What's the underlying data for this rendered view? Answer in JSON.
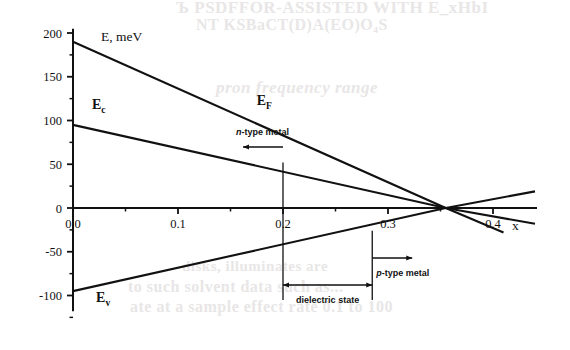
{
  "figure": {
    "background_color": "#ffffff",
    "ink_color": "#111111",
    "bleed_color": "#e8e6e6"
  },
  "bleed_text": {
    "line1": "Ъ PSDFFOR-ASSISTED WITH E_xHbI",
    "line2": "NT KSBaCT(D)A(EO)O₄S",
    "line3": "pron frequency range",
    "line4": "disks, illuminates are",
    "line5": "to such solvent data such as...",
    "line6": "ate at a sample effect rate 0.1 to 100"
  },
  "chart_data": {
    "type": "line",
    "title": "",
    "xlabel": "x",
    "ylabel": "E, meV",
    "xlim": [
      0,
      0.44
    ],
    "ylim": [
      -120,
      210
    ],
    "grid": false,
    "legend": "inline-labels",
    "x_ticks_major": [
      0.0,
      0.1,
      0.2,
      0.3,
      0.4
    ],
    "x_tick_labels": [
      "0.0",
      "0.1",
      "0.2",
      "0.3",
      "0.4"
    ],
    "x_ticks_minor": [
      0.05,
      0.15,
      0.25,
      0.35
    ],
    "y_ticks_major": [
      200,
      150,
      100,
      50,
      0,
      -50,
      -100
    ],
    "y_tick_labels": [
      "200",
      "150",
      "100",
      "50",
      "0",
      "-50",
      "-100"
    ],
    "y_ticks_minor": [
      175,
      125,
      75,
      25,
      -25,
      -75,
      -125
    ],
    "series": [
      {
        "name": "E_F",
        "label": "E",
        "sublabel": "F",
        "points": [
          [
            0.0,
            190
          ],
          [
            0.355,
            0
          ],
          [
            0.41,
            -28
          ]
        ],
        "label_x": 0.175,
        "label_y": 118
      },
      {
        "name": "E_c",
        "label": "E",
        "sublabel": "c",
        "points": [
          [
            0.0,
            95
          ],
          [
            0.355,
            0
          ],
          [
            0.44,
            -18
          ]
        ],
        "label_x": 0.018,
        "label_y": 113
      },
      {
        "name": "E_v",
        "label": "E",
        "sublabel": "v",
        "points": [
          [
            0.0,
            -95
          ],
          [
            0.355,
            0
          ],
          [
            0.44,
            19
          ]
        ],
        "label_x": 0.022,
        "label_y": -107
      }
    ],
    "crossings": {
      "EF_crosses_Ec": {
        "x": 0.2,
        "y": 41
      },
      "EF_crosses_Ev": {
        "x": 0.285,
        "y": -38
      },
      "all_converge": {
        "x": 0.355,
        "y": 0
      }
    },
    "annotations": [
      {
        "name": "n-type-metal",
        "italic_prefix": "n",
        "text": "-type metal",
        "at_x": 0.2,
        "arrow_direction": "left",
        "region": "x < 0.2"
      },
      {
        "name": "p-type-metal",
        "italic_prefix": "p",
        "text": "-type metal",
        "at_x": 0.285,
        "arrow_direction": "right",
        "region": "x > 0.285"
      },
      {
        "name": "dielectric-state",
        "text": "dielectric state",
        "span_from_x": 0.2,
        "span_to_x": 0.285,
        "arrow_direction": "both"
      }
    ]
  }
}
